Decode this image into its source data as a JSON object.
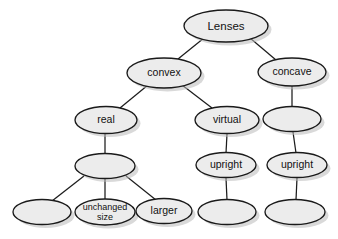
{
  "diagram": {
    "type": "tree",
    "colors": {
      "node_fill": "#ececec",
      "node_stroke": "#1a1a1a",
      "edge_stroke": "#1c1c1c",
      "label_color": "#111111",
      "background": "#ffffff",
      "shadow": "#b9b9b9"
    },
    "nodes": [
      {
        "id": "lenses",
        "label": "Lenses",
        "label2": "",
        "cx": 226,
        "cy": 26,
        "rx": 42,
        "ry": 16,
        "font_size": 11.5
      },
      {
        "id": "convex",
        "label": "convex",
        "label2": "",
        "cx": 164,
        "cy": 73,
        "rx": 37,
        "ry": 15,
        "font_size": 10.5
      },
      {
        "id": "concave",
        "label": "concave",
        "label2": "",
        "cx": 292,
        "cy": 72,
        "rx": 34,
        "ry": 14,
        "font_size": 10.5
      },
      {
        "id": "real",
        "label": "real",
        "label2": "",
        "cx": 106,
        "cy": 120,
        "rx": 31,
        "ry": 13.5,
        "font_size": 10.5
      },
      {
        "id": "virtual",
        "label": "virtual",
        "label2": "",
        "cx": 227,
        "cy": 120,
        "rx": 32,
        "ry": 13.5,
        "font_size": 10.5
      },
      {
        "id": "concave-c1",
        "label": "",
        "label2": "",
        "cx": 292,
        "cy": 119,
        "rx": 29,
        "ry": 12.5,
        "font_size": 10.5
      },
      {
        "id": "real-c1",
        "label": "",
        "label2": "",
        "cx": 105,
        "cy": 166,
        "rx": 30,
        "ry": 12.5,
        "font_size": 10.5
      },
      {
        "id": "upright-v",
        "label": "upright",
        "label2": "",
        "cx": 226,
        "cy": 165,
        "rx": 30,
        "ry": 12.5,
        "font_size": 10.5
      },
      {
        "id": "upright-c",
        "label": "upright",
        "label2": "",
        "cx": 297,
        "cy": 165,
        "rx": 30,
        "ry": 12.5,
        "font_size": 10.5
      },
      {
        "id": "bottom-1",
        "label": "",
        "label2": "",
        "cx": 42,
        "cy": 212,
        "rx": 29,
        "ry": 12.5,
        "font_size": 10.5
      },
      {
        "id": "unchanged",
        "label": "unchanged",
        "label2": "size",
        "cx": 105,
        "cy": 212,
        "rx": 30,
        "ry": 13,
        "font_size": 9
      },
      {
        "id": "larger",
        "label": "larger",
        "label2": "",
        "cx": 164,
        "cy": 211,
        "rx": 28,
        "ry": 12.5,
        "font_size": 10.5
      },
      {
        "id": "bottom-v",
        "label": "",
        "label2": "",
        "cx": 227,
        "cy": 212,
        "rx": 29,
        "ry": 12.5,
        "font_size": 10.5
      },
      {
        "id": "bottom-c",
        "label": "",
        "label2": "",
        "cx": 295,
        "cy": 212,
        "rx": 30,
        "ry": 12.5,
        "font_size": 10.5
      }
    ],
    "edges": [
      {
        "from": "lenses",
        "to": "convex",
        "x1": 204,
        "y1": 38,
        "x2": 178,
        "y2": 59
      },
      {
        "from": "lenses",
        "to": "concave",
        "x1": 250,
        "y1": 38,
        "x2": 276,
        "y2": 60
      },
      {
        "from": "convex",
        "to": "real",
        "x1": 148,
        "y1": 85,
        "x2": 120,
        "y2": 108
      },
      {
        "from": "convex",
        "to": "virtual",
        "x1": 182,
        "y1": 85,
        "x2": 212,
        "y2": 108
      },
      {
        "from": "concave",
        "to": "concave-c1",
        "x1": 292,
        "y1": 86,
        "x2": 292,
        "y2": 107
      },
      {
        "from": "real",
        "to": "real-c1",
        "x1": 105,
        "y1": 134,
        "x2": 105,
        "y2": 154
      },
      {
        "from": "virtual",
        "to": "upright-v",
        "x1": 227,
        "y1": 134,
        "x2": 226,
        "y2": 153
      },
      {
        "from": "concave-c1",
        "to": "upright-c",
        "x1": 293,
        "y1": 132,
        "x2": 296,
        "y2": 153
      },
      {
        "from": "real-c1",
        "to": "bottom-1",
        "x1": 84,
        "y1": 176,
        "x2": 52,
        "y2": 201
      },
      {
        "from": "real-c1",
        "to": "unchanged",
        "x1": 105,
        "y1": 179,
        "x2": 105,
        "y2": 199
      },
      {
        "from": "real-c1",
        "to": "larger",
        "x1": 126,
        "y1": 176,
        "x2": 156,
        "y2": 200
      },
      {
        "from": "upright-v",
        "to": "bottom-v",
        "x1": 226,
        "y1": 178,
        "x2": 227,
        "y2": 200
      },
      {
        "from": "upright-c",
        "to": "bottom-c",
        "x1": 297,
        "y1": 178,
        "x2": 296,
        "y2": 200
      }
    ]
  }
}
